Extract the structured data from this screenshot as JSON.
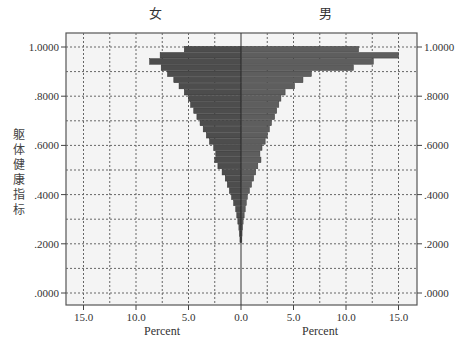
{
  "chart_data": {
    "type": "bar",
    "subtype": "population-pyramid (back-to-back histogram)",
    "title_left": "女",
    "title_right": "男",
    "ylabel": "躯体健康指标",
    "xlabel_left": "Percent",
    "xlabel_right": "Percent",
    "y_ticks": [
      ".0000",
      ".2000",
      ".4000",
      ".6000",
      ".8000",
      "1.0000"
    ],
    "x_ticks_left": [
      "15.0",
      "10.0",
      "5.0",
      "0.0"
    ],
    "x_ticks_right": [
      "0.0",
      "5.0",
      "10.0",
      "15.0"
    ],
    "xlim": [
      0,
      16.5
    ],
    "ylim": [
      -0.03,
      1.04
    ],
    "grid": true,
    "bin_width": 0.025,
    "categories": [
      0.99,
      0.965,
      0.94,
      0.915,
      0.89,
      0.865,
      0.84,
      0.815,
      0.79,
      0.765,
      0.74,
      0.715,
      0.69,
      0.665,
      0.64,
      0.615,
      0.59,
      0.565,
      0.54,
      0.515,
      0.49,
      0.465,
      0.44,
      0.415,
      0.39,
      0.365,
      0.34,
      0.315,
      0.29,
      0.265,
      0.24,
      0.215
    ],
    "series": [
      {
        "name": "女",
        "side": "left",
        "values": [
          5.4,
          7.7,
          8.7,
          7.6,
          7.0,
          6.4,
          5.9,
          5.4,
          5.0,
          4.8,
          4.5,
          4.2,
          3.9,
          3.6,
          3.3,
          3.0,
          2.6,
          2.4,
          2.5,
          2.2,
          1.8,
          1.5,
          1.3,
          1.1,
          0.9,
          0.7,
          0.5,
          0.4,
          0.3,
          0.2,
          0.15,
          0.1
        ]
      },
      {
        "name": "男",
        "side": "right",
        "values": [
          11.2,
          15.0,
          12.6,
          10.7,
          6.7,
          5.9,
          5.1,
          4.2,
          3.8,
          3.6,
          3.4,
          3.2,
          2.9,
          2.7,
          2.5,
          2.3,
          2.0,
          1.8,
          1.9,
          1.6,
          1.4,
          1.2,
          1.0,
          0.8,
          0.6,
          0.5,
          0.4,
          0.3,
          0.2,
          0.15,
          0.1,
          0.08
        ]
      }
    ],
    "colors": {
      "bar_left": "#4d4d4d",
      "bar_right": "#5e5e5e",
      "plot_bg": "#f4f4f4",
      "grid": "#666666",
      "frame": "#555555"
    }
  }
}
